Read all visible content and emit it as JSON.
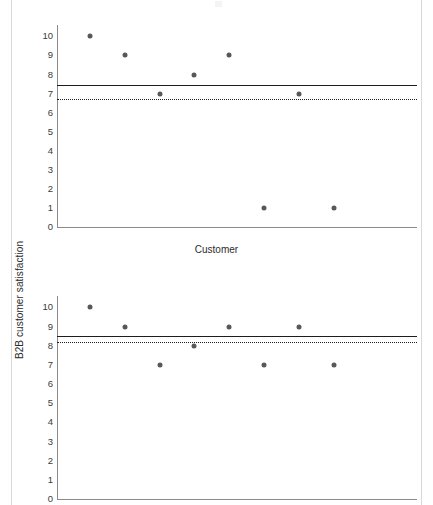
{
  "figure": {
    "background": "#ffffff",
    "marker_color": "#585858",
    "line_color": "#1d1d1d",
    "axis_color": "#8a8a8a",
    "x_axis_title": "Customer",
    "y_axis_title": "B2B customer satisfaction",
    "y_tick_labels": [
      "10",
      "9",
      "8",
      "7",
      "6",
      "5",
      "4",
      "3",
      "2",
      "1",
      "0"
    ]
  },
  "chart_data": [
    {
      "type": "scatter",
      "title": "",
      "xlabel": "",
      "ylabel": "B2B customer satisfaction",
      "ylim": [
        0,
        10.6
      ],
      "yticks": [
        0,
        1,
        2,
        3,
        4,
        5,
        6,
        7,
        8,
        9,
        10
      ],
      "grid": false,
      "legend": "none",
      "x": [
        1,
        2,
        3,
        4,
        5,
        6,
        7,
        8
      ],
      "values": [
        10,
        9,
        7,
        8,
        9,
        7,
        9,
        7
      ],
      "points": [
        {
          "x": 1,
          "y": 10
        },
        {
          "x": 2,
          "y": 9
        },
        {
          "x": 3,
          "y": 7
        },
        {
          "x": 4,
          "y": 8
        },
        {
          "x": 5,
          "y": 9
        },
        {
          "x": 6,
          "y": 1
        },
        {
          "x": 7,
          "y": 7
        },
        {
          "x": 8,
          "y": 1
        }
      ],
      "reference_lines": [
        {
          "name": "mean-line",
          "style": "solid",
          "value": 7.45
        },
        {
          "name": "reference-line",
          "style": "dotted",
          "value": 6.7
        }
      ]
    },
    {
      "type": "scatter",
      "title": "",
      "xlabel": "Customer",
      "ylabel": "B2B customer satisfaction",
      "ylim": [
        0,
        10.6
      ],
      "yticks": [
        0,
        1,
        2,
        3,
        4,
        5,
        6,
        7,
        8,
        9,
        10
      ],
      "grid": false,
      "legend": "none",
      "x": [
        1,
        2,
        3,
        4,
        5,
        6,
        7,
        8
      ],
      "values": [
        10,
        9,
        7,
        8,
        9,
        7,
        9,
        7
      ],
      "points": [
        {
          "x": 1,
          "y": 10
        },
        {
          "x": 2,
          "y": 9
        },
        {
          "x": 3,
          "y": 7
        },
        {
          "x": 4,
          "y": 8
        },
        {
          "x": 5,
          "y": 9
        },
        {
          "x": 6,
          "y": 7
        },
        {
          "x": 7,
          "y": 9
        },
        {
          "x": 8,
          "y": 7
        }
      ],
      "reference_lines": [
        {
          "name": "mean-line",
          "style": "solid",
          "value": 8.5
        },
        {
          "name": "reference-line",
          "style": "dotted",
          "value": 8.2
        }
      ]
    }
  ]
}
